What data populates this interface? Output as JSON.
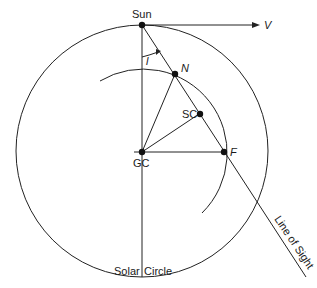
{
  "labels": {
    "sun": "Sun",
    "velocity": "V",
    "angle": "l",
    "n_point": "N",
    "sc_point": "SC",
    "gc_point": "GC",
    "f_point": "F",
    "line_of_sight": "Line of Sight",
    "solar_circle_left": "Solar",
    "solar_circle_right": "Circle"
  }
}
